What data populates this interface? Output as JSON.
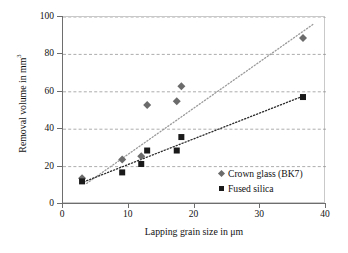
{
  "chart_data": {
    "type": "scatter",
    "title": "",
    "xlabel": "Lapping grain size in μm",
    "ylabel": "Removal volume in mm³",
    "ylabel_base": "Removal volume in mm",
    "ylabel_sup": "3",
    "xlim": [
      0,
      40
    ],
    "ylim": [
      0,
      100
    ],
    "xticks": [
      0,
      10,
      20,
      30,
      40
    ],
    "yticks": [
      0,
      20,
      40,
      60,
      80,
      100
    ],
    "xtick_labels": [
      "0",
      "10",
      "20",
      "30",
      "40"
    ],
    "ytick_labels": [
      "0",
      "20",
      "40",
      "60",
      "80",
      "100"
    ],
    "grid": "horizontal-dashed",
    "legend_position": "inside-lower-right",
    "series": [
      {
        "name": "Crown glass (BK7)",
        "marker": "diamond",
        "color": "#6b6b6b",
        "trendline": {
          "style": "dotted",
          "color": "#9a9a9a",
          "x": [
            3.6,
            38.2
          ],
          "y": [
            11.0,
            96.5
          ]
        },
        "points": [
          {
            "x": 2.9,
            "y": 13.8
          },
          {
            "x": 9.0,
            "y": 23.8
          },
          {
            "x": 11.9,
            "y": 25.6
          },
          {
            "x": 12.8,
            "y": 53.0
          },
          {
            "x": 17.3,
            "y": 55.0
          },
          {
            "x": 18.0,
            "y": 63.0
          },
          {
            "x": 36.5,
            "y": 88.8
          }
        ]
      },
      {
        "name": "Fused silica",
        "marker": "square",
        "color": "#1a1a1a",
        "trendline": {
          "style": "dotted",
          "color": "#2b2b2b",
          "x": [
            2.7,
            37.1
          ],
          "y": [
            11.2,
            58.5
          ]
        },
        "points": [
          {
            "x": 2.9,
            "y": 12.1
          },
          {
            "x": 9.0,
            "y": 16.9
          },
          {
            "x": 11.9,
            "y": 21.4
          },
          {
            "x": 12.8,
            "y": 28.6
          },
          {
            "x": 17.3,
            "y": 28.6
          },
          {
            "x": 18.0,
            "y": 35.8
          },
          {
            "x": 36.5,
            "y": 57.2
          }
        ]
      }
    ],
    "legend": [
      {
        "label": "Crown glass (BK7)",
        "marker": "diamond",
        "color": "#6b6b6b"
      },
      {
        "label": "Fused silica",
        "marker": "square",
        "color": "#1a1a1a"
      }
    ]
  },
  "colors": {
    "axis": "#6e6e6e",
    "frame": "#c9c9c9",
    "grid": "#8a8a8a",
    "text": "#111111",
    "background": "#ffffff"
  }
}
